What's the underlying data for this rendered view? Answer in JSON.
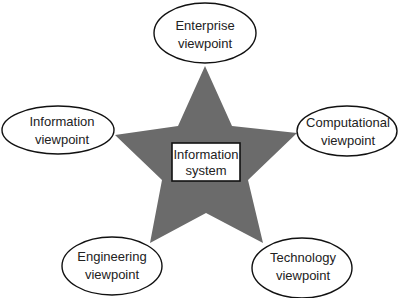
{
  "diagram": {
    "colors": {
      "star_fill": "#6b6b6b",
      "outline": "#111111",
      "background": "#ffffff"
    },
    "center": {
      "line1": "Information",
      "line2": "system"
    },
    "viewpoints": [
      {
        "id": "enterprise",
        "line1": "Enterprise",
        "line2": "viewpoint"
      },
      {
        "id": "information",
        "line1": "Information",
        "line2": "viewpoint"
      },
      {
        "id": "computational",
        "line1": "Computational",
        "line2": "viewpoint"
      },
      {
        "id": "engineering",
        "line1": "Engineering",
        "line2": "viewpoint"
      },
      {
        "id": "technology",
        "line1": "Technology",
        "line2": "viewpoint"
      }
    ]
  }
}
